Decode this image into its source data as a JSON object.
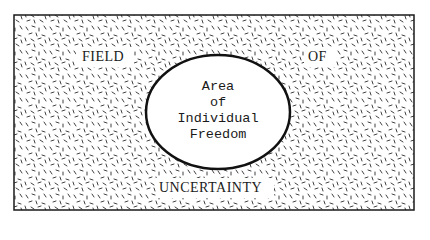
{
  "diagram": {
    "field_words": [
      "FIELD",
      "OF",
      "UNCERTAINTY"
    ],
    "center_lines": [
      "Area",
      "of",
      "Individual",
      "Freedom"
    ],
    "colors": {
      "background": "#ffffff",
      "stroke": "#1a1a1a",
      "stipple": "#2a2a2a",
      "ellipse_fill": "#ffffff"
    }
  }
}
